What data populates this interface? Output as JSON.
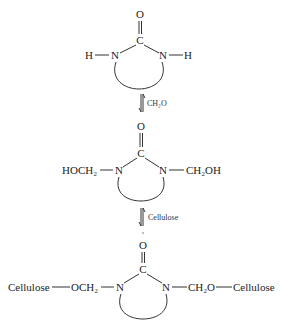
{
  "diagram": {
    "type": "reaction-scheme",
    "step1": {
      "structure": "cyclic urea",
      "carbonyl_O": "O",
      "carbonyl_C": "C",
      "left_N": "N",
      "right_N": "N",
      "left_substituent": "H",
      "right_substituent": "H"
    },
    "arrow1": {
      "type": "equilibrium",
      "reagent": "CH₂O"
    },
    "step2": {
      "structure": "dimethylol cyclic urea",
      "carbonyl_O": "O",
      "carbonyl_C": "C",
      "left_N": "N",
      "right_N": "N",
      "left_substituent": "HOCH₂",
      "right_substituent": "CH₂OH"
    },
    "arrow2": {
      "type": "equilibrium",
      "reagent": "Cellulose"
    },
    "step3": {
      "structure": "crosslinked cellulose",
      "carbonyl_O": "O",
      "carbonyl_C": "C",
      "left_N": "N",
      "right_N": "N",
      "left_outer": "Cellulose",
      "left_linker": "OCH₂",
      "right_linker": "CH₂O",
      "right_outer": "Cellulose"
    }
  }
}
